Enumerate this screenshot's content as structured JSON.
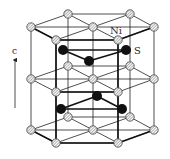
{
  "diagram": {
    "labels": {
      "ni": "Ni",
      "s": "S",
      "axis": "c"
    },
    "colors": {
      "line": "#222222",
      "s_atom": "#111111",
      "ni_fill": "#dddddd"
    },
    "layers": {
      "top": [
        [
          31,
          27
        ],
        [
          68,
          14
        ],
        [
          130,
          14
        ],
        [
          154,
          27
        ],
        [
          93,
          27
        ],
        [
          56,
          40
        ],
        [
          118,
          40
        ]
      ],
      "middle": [
        [
          31,
          79
        ],
        [
          68,
          66
        ],
        [
          130,
          66
        ],
        [
          154,
          79
        ],
        [
          93,
          79
        ],
        [
          56,
          92
        ],
        [
          118,
          92
        ]
      ],
      "bottom": [
        [
          31,
          130
        ],
        [
          68,
          117
        ],
        [
          130,
          117
        ],
        [
          154,
          130
        ],
        [
          93,
          130
        ],
        [
          56,
          143
        ],
        [
          118,
          143
        ]
      ]
    },
    "s_atoms": [
      [
        63,
        50
      ],
      [
        126,
        50
      ],
      [
        89,
        61
      ],
      [
        97,
        96
      ],
      [
        61,
        109
      ],
      [
        122,
        109
      ]
    ]
  }
}
